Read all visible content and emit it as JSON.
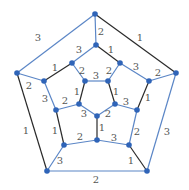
{
  "colors": {
    "blue": "#5b86c6",
    "black": "#2a2a2a",
    "vertex": "#2f64b8",
    "label": "#555555"
  },
  "vertices": [
    {
      "id": "O0",
      "x": 95,
      "y": 14
    },
    {
      "id": "O1",
      "x": 176,
      "y": 73
    },
    {
      "id": "O2",
      "x": 147,
      "y": 171
    },
    {
      "id": "O3",
      "x": 47,
      "y": 171
    },
    {
      "id": "O4",
      "x": 17,
      "y": 73
    },
    {
      "id": "M0",
      "x": 96,
      "y": 45
    },
    {
      "id": "MA",
      "x": 120,
      "y": 63
    },
    {
      "id": "MB",
      "x": 149,
      "y": 81
    },
    {
      "id": "MC",
      "x": 137,
      "y": 110
    },
    {
      "id": "MD",
      "x": 129,
      "y": 145
    },
    {
      "id": "ME",
      "x": 97,
      "y": 140
    },
    {
      "id": "MF",
      "x": 64,
      "y": 145
    },
    {
      "id": "MG",
      "x": 56,
      "y": 110
    },
    {
      "id": "MH",
      "x": 44,
      "y": 81
    },
    {
      "id": "MI",
      "x": 72,
      "y": 63
    },
    {
      "id": "P0",
      "x": 85,
      "y": 81
    },
    {
      "id": "P1",
      "x": 108,
      "y": 81
    },
    {
      "id": "P2",
      "x": 115,
      "y": 104
    },
    {
      "id": "P3",
      "x": 97,
      "y": 116
    },
    {
      "id": "P4",
      "x": 79,
      "y": 104
    }
  ],
  "edges": [
    {
      "from": "O0",
      "to": "O4",
      "color": "blue",
      "label": "3",
      "lx": 38,
      "ly": 37
    },
    {
      "from": "O0",
      "to": "O1",
      "color": "black",
      "label": "1",
      "lx": 140,
      "ly": 37
    },
    {
      "from": "O1",
      "to": "O2",
      "color": "blue",
      "label": "3",
      "lx": 167,
      "ly": 131
    },
    {
      "from": "O2",
      "to": "O3",
      "color": "blue",
      "label": "2",
      "lx": 96,
      "ly": 179
    },
    {
      "from": "O3",
      "to": "O4",
      "color": "black",
      "label": "1",
      "lx": 26,
      "ly": 130
    },
    {
      "from": "O0",
      "to": "M0",
      "color": "blue",
      "label": "2",
      "lx": 101,
      "ly": 31
    },
    {
      "from": "O1",
      "to": "MB",
      "color": "blue",
      "label": "2",
      "lx": 158,
      "ly": 72
    },
    {
      "from": "O4",
      "to": "MH",
      "color": "blue",
      "label": "2",
      "lx": 29,
      "ly": 85
    },
    {
      "from": "O3",
      "to": "MF",
      "color": "blue",
      "label": "3",
      "lx": 60,
      "ly": 160
    },
    {
      "from": "O2",
      "to": "MD",
      "color": "black",
      "label": "1",
      "lx": 131,
      "ly": 160
    },
    {
      "from": "M0",
      "to": "MA",
      "color": "black",
      "label": "1",
      "lx": 111,
      "ly": 49
    },
    {
      "from": "MA",
      "to": "MB",
      "color": "blue",
      "label": "3",
      "lx": 136,
      "ly": 66
    },
    {
      "from": "MB",
      "to": "MC",
      "color": "black",
      "label": "1",
      "lx": 148,
      "ly": 97
    },
    {
      "from": "MC",
      "to": "MD",
      "color": "blue",
      "label": "2",
      "lx": 137,
      "ly": 131
    },
    {
      "from": "MD",
      "to": "ME",
      "color": "blue",
      "label": "3",
      "lx": 114,
      "ly": 137
    },
    {
      "from": "ME",
      "to": "MF",
      "color": "blue",
      "label": "2",
      "lx": 80,
      "ly": 136
    },
    {
      "from": "MF",
      "to": "MG",
      "color": "black",
      "label": "1",
      "lx": 55,
      "ly": 130
    },
    {
      "from": "MG",
      "to": "MH",
      "color": "blue",
      "label": "3",
      "lx": 45,
      "ly": 98
    },
    {
      "from": "MH",
      "to": "MI",
      "color": "black",
      "label": "1",
      "lx": 55,
      "ly": 67
    },
    {
      "from": "MI",
      "to": "M0",
      "color": "blue",
      "label": "3",
      "lx": 79,
      "ly": 49
    },
    {
      "from": "MI",
      "to": "P0",
      "color": "blue",
      "label": "2",
      "lx": 82,
      "ly": 70
    },
    {
      "from": "MA",
      "to": "P1",
      "color": "blue",
      "label": "2",
      "lx": 109,
      "ly": 70
    },
    {
      "from": "MC",
      "to": "P2",
      "color": "blue",
      "label": "3",
      "lx": 126,
      "ly": 101
    },
    {
      "from": "ME",
      "to": "P3",
      "color": "black",
      "label": "1",
      "lx": 102,
      "ly": 127
    },
    {
      "from": "MG",
      "to": "P4",
      "color": "blue",
      "label": "2",
      "lx": 65,
      "ly": 100
    },
    {
      "from": "P0",
      "to": "P1",
      "color": "blue",
      "label": "3",
      "lx": 96,
      "ly": 75
    },
    {
      "from": "P1",
      "to": "P2",
      "color": "black",
      "label": "1",
      "lx": 116,
      "ly": 91
    },
    {
      "from": "P2",
      "to": "P3",
      "color": "blue",
      "label": "2",
      "lx": 108,
      "ly": 113
    },
    {
      "from": "P3",
      "to": "P4",
      "color": "blue",
      "label": "3",
      "lx": 84,
      "ly": 113
    },
    {
      "from": "P4",
      "to": "P0",
      "color": "black",
      "label": "1",
      "lx": 77,
      "ly": 91
    }
  ]
}
